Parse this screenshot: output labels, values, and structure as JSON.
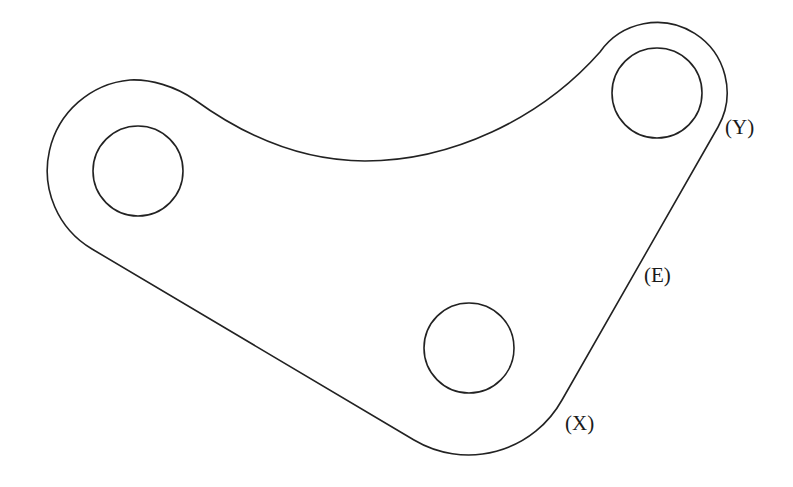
{
  "diagram": {
    "type": "mechanical-link-plate",
    "stroke_color": "#222222",
    "background": "#ffffff",
    "holes": [
      {
        "name": "left-hole",
        "cx": 138,
        "cy": 171,
        "r": 45
      },
      {
        "name": "top-right-hole",
        "cx": 657,
        "cy": 93,
        "r": 45
      },
      {
        "name": "bottom-hole",
        "cx": 469,
        "cy": 348,
        "r": 45
      }
    ],
    "labels": [
      {
        "name": "label-y",
        "text": "(Y)",
        "x": 725,
        "y": 117
      },
      {
        "name": "label-e",
        "text": "(E)",
        "x": 644,
        "y": 265
      },
      {
        "name": "label-x",
        "text": "(X)",
        "x": 565,
        "y": 413
      }
    ]
  }
}
